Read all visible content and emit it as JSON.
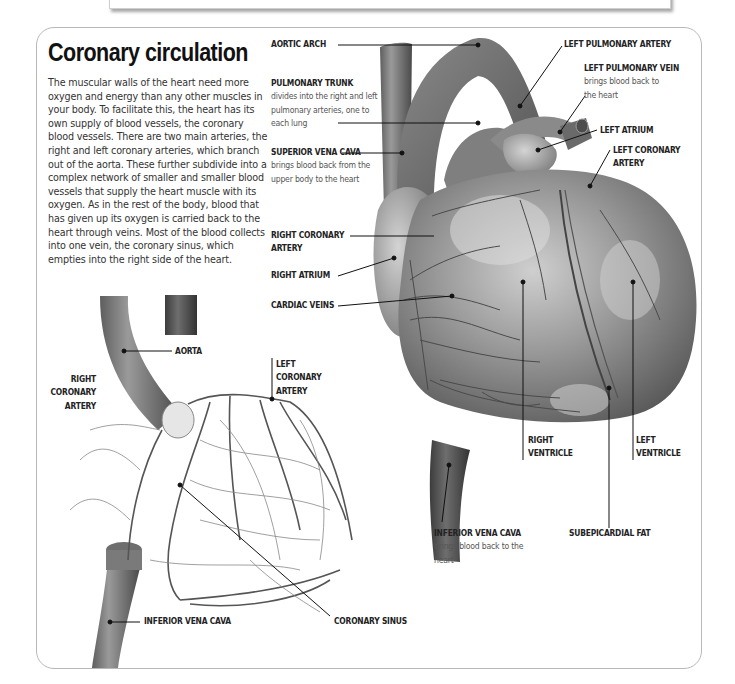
{
  "page": {
    "title": "Coronary circulation",
    "intro": "The muscular walls of the heart need more oxygen and energy than any other muscles in your body. To facilitate this, the heart has its own supply of blood vessels, the coronary blood vessels. There are two main arteries, the right and left coronary arteries, which branch out of the aorta. These further subdivide into a complex network of smaller and smaller blood vessels that supply the heart muscle with its oxygen. As in the rest of the body, blood that has given up its oxygen is carried back to the heart through veins. Most of the blood collects into one vein, the coronary sinus, which empties into the right side of the heart."
  },
  "heart_labels": {
    "aortic_arch": {
      "name": "AORTIC ARCH"
    },
    "pulmonary_trunk": {
      "name": "PULMONARY TRUNK",
      "desc": "divides into the right and left pulmonary arteries, one to each lung"
    },
    "superior_vena_cava": {
      "name": "SUPERIOR VENA CAVA",
      "desc": "brings blood back from the upper body to the heart"
    },
    "right_coronary_artery": {
      "name": "RIGHT CORONARY ARTERY"
    },
    "right_atrium": {
      "name": "RIGHT ATRIUM"
    },
    "cardiac_veins": {
      "name": "CARDIAC VEINS"
    },
    "left_pulmonary_artery": {
      "name": "LEFT PULMONARY ARTERY"
    },
    "left_pulmonary_vein": {
      "name": "LEFT PULMONARY VEIN",
      "desc": "brings blood back to the heart"
    },
    "left_atrium": {
      "name": "LEFT ATRIUM"
    },
    "left_coronary_artery": {
      "name": "LEFT CORONARY ARTERY"
    },
    "right_ventricle": {
      "name": "RIGHT VENTRICLE"
    },
    "left_ventricle": {
      "name": "LEFT VENTRICLE"
    },
    "inferior_vena_cava": {
      "name": "INFERIOR VENA CAVA",
      "desc": "brings blood back to the heart"
    },
    "subepicardial_fat": {
      "name": "SUBEPICARDIAL FAT"
    }
  },
  "network_labels": {
    "aorta": {
      "name": "AORTA"
    },
    "right_coronary_artery": {
      "name": "RIGHT CORONARY ARTERY"
    },
    "left_coronary_artery": {
      "name": "LEFT CORONARY ARTERY"
    },
    "inferior_vena_cava": {
      "name": "INFERIOR VENA CAVA"
    },
    "coronary_sinus": {
      "name": "CORONARY SINUS"
    }
  },
  "colors": {
    "frame_border": "#b8b8b8",
    "vessel_dark": "#5a5a5a",
    "vessel_mid": "#7a7a7a",
    "heart_body": "#8c8c8c",
    "heart_highlight": "#d8d8d8",
    "leader_line": "#111111"
  }
}
